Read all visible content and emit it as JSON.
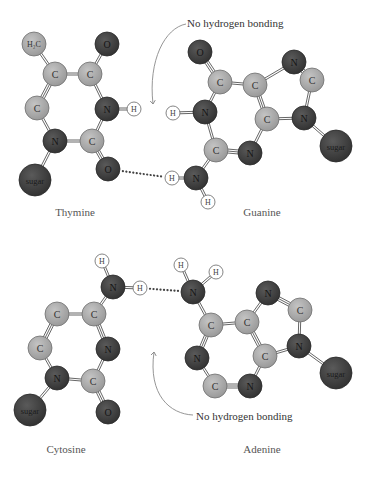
{
  "colors": {
    "carbon": "#a6a6a6",
    "nitrogen": "#3f3f3f",
    "oxygen": "#4a4a4a",
    "hydrogen": "#ffffff",
    "sugar": "#454545",
    "bond": "#555555",
    "hbond": "#444444",
    "arrow": "#888888",
    "caption": "#555555"
  },
  "annotations": {
    "top_note": "No hydrogen bonding",
    "bottom_note": "No hydrogen bonding"
  },
  "captions": {
    "thymine": "Thymine",
    "guanine": "Guanine",
    "cytosine": "Cytosine",
    "adenine": "Adenine"
  },
  "molecules": [
    {
      "name": "Thymine",
      "atoms": [
        {
          "id": "t_ch3",
          "label": "H₂C",
          "type": "carbon",
          "x": 34,
          "y": 44,
          "r": 12
        },
        {
          "id": "t_o1",
          "label": "O",
          "type": "oxygen",
          "x": 107,
          "y": 44,
          "r": 12
        },
        {
          "id": "t_c5",
          "label": "C",
          "type": "carbon",
          "x": 55,
          "y": 74,
          "r": 12
        },
        {
          "id": "t_c4",
          "label": "C",
          "type": "carbon",
          "x": 90,
          "y": 74,
          "r": 12
        },
        {
          "id": "t_c6",
          "label": "C",
          "type": "carbon",
          "x": 37,
          "y": 108,
          "r": 12
        },
        {
          "id": "t_n3",
          "label": "N",
          "type": "nitrogen",
          "x": 107,
          "y": 109,
          "r": 12
        },
        {
          "id": "t_h3",
          "label": "H",
          "type": "hydrogen",
          "x": 134,
          "y": 109,
          "r": 7
        },
        {
          "id": "t_n1",
          "label": "N",
          "type": "nitrogen",
          "x": 55,
          "y": 141,
          "r": 12
        },
        {
          "id": "t_c2",
          "label": "C",
          "type": "carbon",
          "x": 92,
          "y": 141,
          "r": 12
        },
        {
          "id": "t_sugar",
          "label": "sugar",
          "type": "sugar",
          "x": 35,
          "y": 180,
          "r": 16
        },
        {
          "id": "t_o2",
          "label": "O",
          "type": "oxygen",
          "x": 108,
          "y": 169,
          "r": 12
        }
      ]
    },
    {
      "name": "Guanine",
      "atoms": [
        {
          "id": "g_o6",
          "label": "O",
          "type": "oxygen",
          "x": 200,
          "y": 52,
          "r": 12
        },
        {
          "id": "g_c6",
          "label": "C",
          "type": "carbon",
          "x": 220,
          "y": 82,
          "r": 12
        },
        {
          "id": "g_c5",
          "label": "C",
          "type": "carbon",
          "x": 255,
          "y": 85,
          "r": 12
        },
        {
          "id": "g_n7",
          "label": "N",
          "type": "nitrogen",
          "x": 294,
          "y": 62,
          "r": 12
        },
        {
          "id": "g_c8",
          "label": "C",
          "type": "carbon",
          "x": 312,
          "y": 80,
          "r": 12
        },
        {
          "id": "g_h1",
          "label": "H",
          "type": "hydrogen",
          "x": 173,
          "y": 113,
          "r": 7
        },
        {
          "id": "g_n1",
          "label": "N",
          "type": "nitrogen",
          "x": 205,
          "y": 112,
          "r": 12
        },
        {
          "id": "g_c4",
          "label": "C",
          "type": "carbon",
          "x": 267,
          "y": 119,
          "r": 12
        },
        {
          "id": "g_n9",
          "label": "N",
          "type": "nitrogen",
          "x": 304,
          "y": 118,
          "r": 12
        },
        {
          "id": "g_c2",
          "label": "C",
          "type": "carbon",
          "x": 216,
          "y": 150,
          "r": 12
        },
        {
          "id": "g_n3",
          "label": "N",
          "type": "nitrogen",
          "x": 250,
          "y": 153,
          "r": 12
        },
        {
          "id": "g_sugar",
          "label": "sugar",
          "type": "sugar",
          "x": 336,
          "y": 146,
          "r": 16
        },
        {
          "id": "g_ha",
          "label": "H",
          "type": "hydrogen",
          "x": 172,
          "y": 178,
          "r": 7
        },
        {
          "id": "g_n2",
          "label": "N",
          "type": "nitrogen",
          "x": 196,
          "y": 178,
          "r": 12
        },
        {
          "id": "g_hb",
          "label": "H",
          "type": "hydrogen",
          "x": 208,
          "y": 202,
          "r": 7
        }
      ]
    },
    {
      "name": "Cytosine",
      "atoms": [
        {
          "id": "c_ha",
          "label": "H",
          "type": "hydrogen",
          "x": 102,
          "y": 261,
          "r": 7
        },
        {
          "id": "c_n4",
          "label": "N",
          "type": "nitrogen",
          "x": 113,
          "y": 287,
          "r": 12
        },
        {
          "id": "c_hb",
          "label": "H",
          "type": "hydrogen",
          "x": 140,
          "y": 288,
          "r": 7
        },
        {
          "id": "c_c5",
          "label": "C",
          "type": "carbon",
          "x": 57,
          "y": 314,
          "r": 12
        },
        {
          "id": "c_c4",
          "label": "C",
          "type": "carbon",
          "x": 94,
          "y": 314,
          "r": 12
        },
        {
          "id": "c_c6",
          "label": "C",
          "type": "carbon",
          "x": 40,
          "y": 348,
          "r": 12
        },
        {
          "id": "c_n3",
          "label": "N",
          "type": "nitrogen",
          "x": 108,
          "y": 349,
          "r": 12
        },
        {
          "id": "c_n1",
          "label": "N",
          "type": "nitrogen",
          "x": 57,
          "y": 378,
          "r": 12
        },
        {
          "id": "c_c2",
          "label": "C",
          "type": "carbon",
          "x": 93,
          "y": 381,
          "r": 12
        },
        {
          "id": "c_sugar",
          "label": "sugar",
          "type": "sugar",
          "x": 30,
          "y": 410,
          "r": 16
        },
        {
          "id": "c_o2",
          "label": "O",
          "type": "oxygen",
          "x": 108,
          "y": 412,
          "r": 12
        }
      ]
    },
    {
      "name": "Adenine",
      "atoms": [
        {
          "id": "a_ha",
          "label": "H",
          "type": "hydrogen",
          "x": 181,
          "y": 265,
          "r": 7
        },
        {
          "id": "a_hb",
          "label": "H",
          "type": "hydrogen",
          "x": 216,
          "y": 272,
          "r": 7
        },
        {
          "id": "a_n6",
          "label": "N",
          "type": "nitrogen",
          "x": 193,
          "y": 292,
          "r": 12
        },
        {
          "id": "a_n7",
          "label": "N",
          "type": "nitrogen",
          "x": 268,
          "y": 293,
          "r": 12
        },
        {
          "id": "a_c8",
          "label": "C",
          "type": "carbon",
          "x": 300,
          "y": 310,
          "r": 12
        },
        {
          "id": "a_c6",
          "label": "C",
          "type": "carbon",
          "x": 211,
          "y": 325,
          "r": 12
        },
        {
          "id": "a_c5",
          "label": "C",
          "type": "carbon",
          "x": 247,
          "y": 322,
          "r": 12
        },
        {
          "id": "a_n9",
          "label": "N",
          "type": "nitrogen",
          "x": 299,
          "y": 346,
          "r": 12
        },
        {
          "id": "a_n1",
          "label": "N",
          "type": "nitrogen",
          "x": 197,
          "y": 358,
          "r": 12
        },
        {
          "id": "a_c4",
          "label": "C",
          "type": "carbon",
          "x": 265,
          "y": 356,
          "r": 12
        },
        {
          "id": "a_sugar",
          "label": "sugar",
          "type": "sugar",
          "x": 336,
          "y": 373,
          "r": 16
        },
        {
          "id": "a_c2",
          "label": "C",
          "type": "carbon",
          "x": 215,
          "y": 386,
          "r": 12
        },
        {
          "id": "a_n3",
          "label": "N",
          "type": "nitrogen",
          "x": 250,
          "y": 386,
          "r": 12
        }
      ]
    }
  ],
  "bonds": [
    [
      "t_ch3",
      "t_c5",
      2
    ],
    [
      "t_c5",
      "t_c4",
      2
    ],
    [
      "t_c4",
      "t_o1",
      2
    ],
    [
      "t_c5",
      "t_c6",
      3
    ],
    [
      "t_c4",
      "t_n3",
      2
    ],
    [
      "t_n3",
      "t_h3",
      2
    ],
    [
      "t_c6",
      "t_n1",
      2
    ],
    [
      "t_n3",
      "t_c2",
      2
    ],
    [
      "t_n1",
      "t_c2",
      2
    ],
    [
      "t_n1",
      "t_sugar",
      2
    ],
    [
      "t_c2",
      "t_o2",
      3
    ],
    [
      "g_o6",
      "g_c6",
      3
    ],
    [
      "g_c6",
      "g_c5",
      2
    ],
    [
      "g_c5",
      "g_n7",
      2
    ],
    [
      "g_n7",
      "g_c8",
      3
    ],
    [
      "g_c8",
      "g_n9",
      2
    ],
    [
      "g_c6",
      "g_n1",
      2
    ],
    [
      "g_h1",
      "g_n1",
      2
    ],
    [
      "g_c5",
      "g_c4",
      3
    ],
    [
      "g_c4",
      "g_n9",
      2
    ],
    [
      "g_n9",
      "g_sugar",
      2
    ],
    [
      "g_n1",
      "g_c2",
      2
    ],
    [
      "g_c2",
      "g_n3",
      3
    ],
    [
      "g_n3",
      "g_c4",
      2
    ],
    [
      "g_c2",
      "g_n2",
      2
    ],
    [
      "g_ha",
      "g_n2",
      2
    ],
    [
      "g_n2",
      "g_hb",
      2
    ],
    [
      "c_ha",
      "c_n4",
      2
    ],
    [
      "c_n4",
      "c_hb",
      2
    ],
    [
      "c_n4",
      "c_c4",
      2
    ],
    [
      "c_c5",
      "c_c4",
      2
    ],
    [
      "c_c5",
      "c_c6",
      3
    ],
    [
      "c_c4",
      "c_n3",
      3
    ],
    [
      "c_c6",
      "c_n1",
      2
    ],
    [
      "c_n3",
      "c_c2",
      2
    ],
    [
      "c_n1",
      "c_c2",
      2
    ],
    [
      "c_n1",
      "c_sugar",
      2
    ],
    [
      "c_c2",
      "c_o2",
      3
    ],
    [
      "a_ha",
      "a_n6",
      2
    ],
    [
      "a_n6",
      "a_hb",
      2
    ],
    [
      "a_n6",
      "a_c6",
      2
    ],
    [
      "a_c6",
      "a_c5",
      2
    ],
    [
      "a_c5",
      "a_n7",
      2
    ],
    [
      "a_n7",
      "a_c8",
      3
    ],
    [
      "a_c8",
      "a_n9",
      2
    ],
    [
      "a_c5",
      "a_c4",
      3
    ],
    [
      "a_c4",
      "a_n9",
      2
    ],
    [
      "a_n9",
      "a_sugar",
      2
    ],
    [
      "a_c6",
      "a_n1",
      3
    ],
    [
      "a_n1",
      "a_c2",
      2
    ],
    [
      "a_c2",
      "a_n3",
      3
    ],
    [
      "a_n3",
      "a_c4",
      2
    ]
  ],
  "hydrogen_bonds": [
    {
      "from": "t_o2",
      "to": "g_ha"
    },
    {
      "from": "c_hb",
      "to": "a_n6"
    }
  ]
}
